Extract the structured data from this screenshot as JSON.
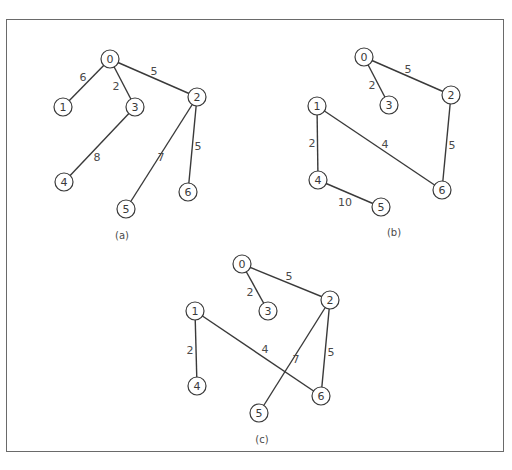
{
  "figure": {
    "node_radius": 9,
    "colors": {
      "stroke": "#3a3a3a",
      "label": "#4a4a4a",
      "frame": "#6a6a6a",
      "background": "#ffffff"
    },
    "graphs": [
      {
        "caption": "(a)",
        "caption_pos": [
          122,
          235
        ],
        "nodes": [
          {
            "id": "0",
            "x": 110,
            "y": 59
          },
          {
            "id": "1",
            "x": 63,
            "y": 107
          },
          {
            "id": "2",
            "x": 197,
            "y": 97
          },
          {
            "id": "3",
            "x": 135,
            "y": 107
          },
          {
            "id": "4",
            "x": 64,
            "y": 182
          },
          {
            "id": "5",
            "x": 126,
            "y": 209
          },
          {
            "id": "6",
            "x": 188,
            "y": 192
          }
        ],
        "edges": [
          {
            "from": "0",
            "to": "1",
            "weight": "6",
            "lx": 83,
            "ly": 77
          },
          {
            "from": "0",
            "to": "3",
            "weight": "2",
            "lx": 116,
            "ly": 86
          },
          {
            "from": "0",
            "to": "2",
            "weight": "5",
            "lx": 154,
            "ly": 71
          },
          {
            "from": "3",
            "to": "4",
            "weight": "8",
            "lx": 97,
            "ly": 157
          },
          {
            "from": "2",
            "to": "5",
            "weight": "7",
            "lx": 161,
            "ly": 157
          },
          {
            "from": "2",
            "to": "6",
            "weight": "5",
            "lx": 198,
            "ly": 146
          }
        ]
      },
      {
        "caption": "(b)",
        "caption_pos": [
          394,
          232
        ],
        "nodes": [
          {
            "id": "0",
            "x": 364,
            "y": 57
          },
          {
            "id": "1",
            "x": 317,
            "y": 106
          },
          {
            "id": "2",
            "x": 451,
            "y": 95
          },
          {
            "id": "3",
            "x": 389,
            "y": 105
          },
          {
            "id": "4",
            "x": 318,
            "y": 180
          },
          {
            "id": "5",
            "x": 381,
            "y": 207
          },
          {
            "id": "6",
            "x": 442,
            "y": 190
          }
        ],
        "edges": [
          {
            "from": "0",
            "to": "3",
            "weight": "2",
            "lx": 372,
            "ly": 85
          },
          {
            "from": "0",
            "to": "2",
            "weight": "5",
            "lx": 408,
            "ly": 69
          },
          {
            "from": "1",
            "to": "4",
            "weight": "2",
            "lx": 312,
            "ly": 143
          },
          {
            "from": "1",
            "to": "6",
            "weight": "4",
            "lx": 385,
            "ly": 144
          },
          {
            "from": "2",
            "to": "6",
            "weight": "5",
            "lx": 452,
            "ly": 145
          },
          {
            "from": "4",
            "to": "5",
            "weight": "10",
            "lx": 345,
            "ly": 202
          }
        ]
      },
      {
        "caption": "(c)",
        "caption_pos": [
          262,
          439
        ],
        "nodes": [
          {
            "id": "0",
            "x": 242,
            "y": 264
          },
          {
            "id": "1",
            "x": 195,
            "y": 311
          },
          {
            "id": "2",
            "x": 330,
            "y": 300
          },
          {
            "id": "3",
            "x": 268,
            "y": 311
          },
          {
            "id": "4",
            "x": 197,
            "y": 386
          },
          {
            "id": "5",
            "x": 259,
            "y": 413
          },
          {
            "id": "6",
            "x": 321,
            "y": 396
          }
        ],
        "edges": [
          {
            "from": "0",
            "to": "3",
            "weight": "2",
            "lx": 250,
            "ly": 292
          },
          {
            "from": "0",
            "to": "2",
            "weight": "5",
            "lx": 289,
            "ly": 276
          },
          {
            "from": "1",
            "to": "4",
            "weight": "2",
            "lx": 190,
            "ly": 350
          },
          {
            "from": "1",
            "to": "6",
            "weight": "4",
            "lx": 265,
            "ly": 349
          },
          {
            "from": "2",
            "to": "5",
            "weight": "7",
            "lx": 296,
            "ly": 359
          },
          {
            "from": "2",
            "to": "6",
            "weight": "5",
            "lx": 331,
            "ly": 352
          }
        ]
      }
    ]
  }
}
